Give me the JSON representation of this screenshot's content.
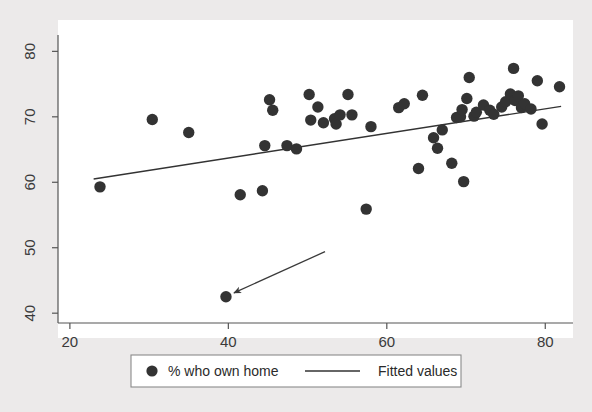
{
  "chart_data": {
    "type": "scatter",
    "title": "",
    "xlabel": "",
    "ylabel": "",
    "xlim": [
      18.5,
      83.5
    ],
    "ylim": [
      38.5,
      82.5
    ],
    "xticks": [
      20,
      40,
      60,
      80
    ],
    "yticks": [
      40,
      50,
      60,
      70,
      80
    ],
    "grid": false,
    "legend_position": "below-plot",
    "marker_color": "#333333",
    "line_color": "#333333",
    "plot_background": "#ffffff",
    "figure_background": "#eceaea",
    "series": [
      {
        "name": "% who own home",
        "type": "scatter",
        "marker": "filled-circle",
        "points": [
          [
            23.8,
            59.3
          ],
          [
            30.4,
            69.6
          ],
          [
            35.0,
            67.6
          ],
          [
            41.5,
            58.1
          ],
          [
            44.3,
            58.7
          ],
          [
            44.6,
            65.6
          ],
          [
            45.2,
            72.6
          ],
          [
            45.6,
            71.0
          ],
          [
            47.4,
            65.6
          ],
          [
            48.6,
            65.1
          ],
          [
            50.2,
            73.4
          ],
          [
            50.4,
            69.5
          ],
          [
            51.3,
            71.5
          ],
          [
            52.0,
            69.1
          ],
          [
            53.4,
            69.7
          ],
          [
            53.6,
            68.9
          ],
          [
            54.1,
            70.3
          ],
          [
            55.1,
            73.4
          ],
          [
            55.6,
            70.3
          ],
          [
            57.4,
            55.9
          ],
          [
            58.0,
            68.5
          ],
          [
            61.5,
            71.4
          ],
          [
            62.2,
            72.0
          ],
          [
            64.0,
            62.1
          ],
          [
            64.5,
            73.3
          ],
          [
            65.9,
            66.8
          ],
          [
            66.4,
            65.2
          ],
          [
            67.0,
            68.0
          ],
          [
            68.2,
            62.9
          ],
          [
            68.8,
            69.9
          ],
          [
            69.3,
            70.0
          ],
          [
            69.5,
            71.1
          ],
          [
            69.7,
            60.1
          ],
          [
            70.1,
            72.8
          ],
          [
            70.4,
            76.0
          ],
          [
            71.0,
            70.1
          ],
          [
            71.3,
            70.7
          ],
          [
            72.2,
            71.8
          ],
          [
            73.0,
            71.0
          ],
          [
            73.5,
            70.4
          ],
          [
            74.5,
            71.5
          ],
          [
            75.0,
            72.3
          ],
          [
            75.6,
            73.5
          ],
          [
            76.0,
            77.4
          ],
          [
            76.2,
            72.5
          ],
          [
            76.6,
            73.2
          ],
          [
            77.0,
            71.4
          ],
          [
            77.4,
            72.0
          ],
          [
            78.2,
            71.2
          ],
          [
            79.0,
            75.5
          ],
          [
            79.6,
            68.9
          ],
          [
            81.8,
            74.6
          ],
          [
            39.7,
            42.5
          ]
        ]
      },
      {
        "name": "Fitted values",
        "type": "line",
        "endpoints": [
          [
            23.0,
            60.5
          ],
          [
            82.0,
            71.6
          ]
        ]
      }
    ],
    "annotations": [
      {
        "name": "outlier-arrow",
        "type": "arrow",
        "from": [
          52.2,
          49.4
        ],
        "to": [
          40.7,
          43.1
        ]
      }
    ]
  },
  "legend": {
    "marker_label": "% who own home",
    "line_label": "Fitted values"
  },
  "axes": {
    "x_tick_labels": [
      "20",
      "40",
      "60",
      "80"
    ],
    "y_tick_labels": [
      "40",
      "50",
      "60",
      "70",
      "80"
    ]
  }
}
